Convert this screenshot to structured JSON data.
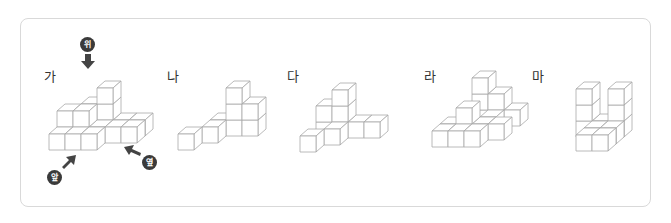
{
  "figures": [
    {
      "label": "가",
      "label_pos": [
        44,
        70
      ],
      "origin": [
        49,
        150
      ],
      "cubes": [
        [
          2,
          2,
          0
        ],
        [
          2,
          2,
          1
        ],
        [
          2,
          2,
          2
        ],
        [
          1,
          2,
          0
        ],
        [
          1,
          2,
          1
        ],
        [
          0,
          2,
          0
        ],
        [
          3,
          2,
          0
        ],
        [
          4,
          2,
          0
        ],
        [
          2,
          1,
          0
        ],
        [
          2,
          0,
          0
        ],
        [
          0,
          1,
          0
        ],
        [
          1,
          0,
          0
        ],
        [
          0,
          0,
          0
        ],
        [
          3,
          1,
          0
        ],
        [
          4,
          1,
          0
        ],
        [
          1,
          1,
          1
        ],
        [
          0,
          1,
          1
        ]
      ]
    },
    {
      "label": "나",
      "label_pos": [
        167,
        70
      ],
      "origin": [
        178,
        150
      ],
      "cubes": [
        [
          2,
          2,
          0
        ],
        [
          2,
          2,
          1
        ],
        [
          2,
          2,
          2
        ],
        [
          3,
          2,
          0
        ],
        [
          3,
          2,
          1
        ],
        [
          1,
          2,
          0
        ],
        [
          1,
          1,
          0
        ],
        [
          0,
          0,
          0
        ]
      ]
    },
    {
      "label": "다",
      "label_pos": [
        287,
        70
      ],
      "origin": [
        300,
        152
      ],
      "cubes": [
        [
          1,
          2,
          0
        ],
        [
          1,
          2,
          1
        ],
        [
          1,
          2,
          2
        ],
        [
          0,
          2,
          0
        ],
        [
          0,
          2,
          1
        ],
        [
          2,
          2,
          0
        ],
        [
          3,
          2,
          0
        ],
        [
          1,
          1,
          0
        ],
        [
          0,
          0,
          0
        ]
      ]
    },
    {
      "label": "라",
      "label_pos": [
        424,
        70
      ],
      "origin": [
        432,
        147
      ],
      "cubes": [
        [
          1,
          3,
          0
        ],
        [
          1,
          3,
          1
        ],
        [
          1,
          3,
          2
        ],
        [
          2,
          3,
          0
        ],
        [
          2,
          3,
          1
        ],
        [
          3,
          3,
          0
        ],
        [
          0,
          1,
          0
        ],
        [
          1,
          1,
          0
        ],
        [
          1,
          1,
          1
        ],
        [
          2,
          1,
          0
        ],
        [
          3,
          1,
          0
        ],
        [
          2,
          2,
          0
        ],
        [
          0,
          0,
          0
        ],
        [
          1,
          0,
          0
        ],
        [
          2,
          0,
          0
        ]
      ]
    },
    {
      "label": "마",
      "label_pos": [
        532,
        70
      ],
      "origin": [
        560,
        151
      ],
      "cubes": [
        [
          0,
          2,
          0
        ],
        [
          0,
          2,
          1
        ],
        [
          0,
          2,
          2
        ],
        [
          2,
          2,
          0
        ],
        [
          2,
          2,
          1
        ],
        [
          2,
          2,
          2
        ],
        [
          1,
          2,
          0
        ],
        [
          1,
          1,
          0
        ],
        [
          2,
          1,
          0
        ],
        [
          1,
          0,
          0
        ],
        [
          2,
          0,
          0
        ]
      ]
    }
  ],
  "direction_markers": {
    "top": {
      "text": "위"
    },
    "front": {
      "text": "앞"
    },
    "side": {
      "text": "옆"
    }
  },
  "colors": {
    "edge": "#a8a8a8",
    "face": "#ffffff",
    "badge": "#3a3a3a",
    "arrow": "#444444",
    "frame": "#d9d9d9"
  },
  "cube_geometry": {
    "size": 16,
    "depth_dx": 8,
    "depth_dy": -7
  }
}
